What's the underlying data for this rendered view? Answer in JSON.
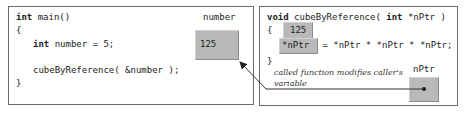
{
  "left_box": {
    "lines": [
      {
        "kw": "int",
        "rest": " main()"
      },
      {
        "kw": "",
        "rest": "{"
      },
      {
        "kw": "int",
        "rest": " number = 5;"
      },
      {
        "kw": "",
        "rest": "cubeByReference( &number );"
      },
      {
        "kw": "",
        "rest": "}"
      }
    ],
    "variable_label": "number",
    "variable_value": "125"
  },
  "right_box": {
    "signature_kw": "void",
    "signature_mid": " cubeByReference( ",
    "signature_kw2": "int",
    "signature_end": " *nPtr )",
    "open_brace": "{",
    "close_brace": "}",
    "deref_value": "125",
    "highlight_expr": "*nPtr",
    "statement_rest": " = *nPtr * *nPtr * *nPtr;",
    "annotation_line1": "called function modifies caller's",
    "annotation_line2": "variable",
    "pointer_label": "nPtr"
  },
  "colors": {
    "cell_fill": "#b9b9b9",
    "border": "#6a6a6a",
    "arrow": "#333333"
  }
}
